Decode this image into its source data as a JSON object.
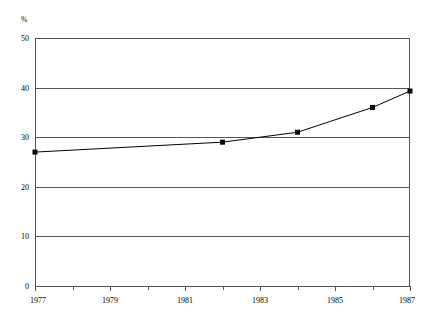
{
  "chart_data": {
    "type": "line",
    "title": "",
    "subtitle": "",
    "xlabel": "",
    "ylabel": "",
    "unit_label": "%",
    "xlim": [
      1977,
      1987
    ],
    "ylim": [
      0,
      50
    ],
    "grid": "horizontal",
    "legend_position": "none",
    "y_ticks": [
      0,
      10,
      20,
      30,
      40,
      50
    ],
    "y_tick_labels": [
      "0",
      "10",
      "20",
      "30",
      "40",
      "50"
    ],
    "x_ticks": [
      1977,
      1978,
      1979,
      1980,
      1981,
      1982,
      1983,
      1984,
      1985,
      1986,
      1987
    ],
    "x_tick_labels_major": [
      "1977",
      "1979",
      "1981",
      "1983",
      "1985",
      "1987"
    ],
    "x_major_ticks": [
      1977,
      1979,
      1981,
      1983,
      1985,
      1987
    ],
    "x": [
      1977,
      1982,
      1984,
      1986,
      1987
    ],
    "values": [
      27,
      29,
      31,
      36,
      39.3
    ],
    "series": [
      {
        "name": "percent",
        "x": [
          1977,
          1982,
          1984,
          1986,
          1987
        ],
        "values": [
          27,
          29,
          31,
          36,
          39.3
        ],
        "marker": "square",
        "marker_color": "#000000",
        "line_color": "#000000"
      }
    ],
    "annotations": []
  },
  "style": {
    "background": "#ffffff",
    "axis_color": "#555555",
    "gridline_color": "#555555",
    "line_color": "#000000",
    "marker_color": "#000000"
  }
}
